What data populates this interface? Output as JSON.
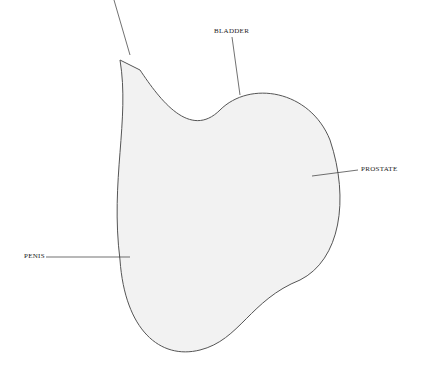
{
  "figure": {
    "type": "anatomical cross-section illustration",
    "style": "black ink engraving on white background",
    "labels": [
      {
        "id": "bladder",
        "text": "BLADDER"
      },
      {
        "id": "prostate",
        "text": "PROSTATE"
      },
      {
        "id": "penis",
        "text": "PENIS"
      }
    ]
  },
  "colors": {
    "ink": "#222222",
    "background": "#ffffff"
  }
}
